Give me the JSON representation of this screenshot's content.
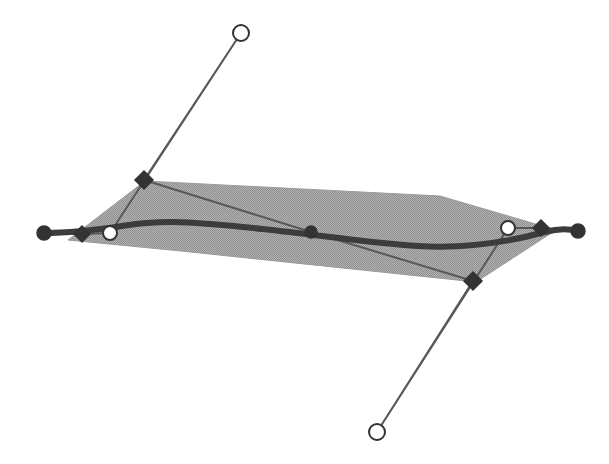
{
  "figure": {
    "title": "Spline curve with control polygon and shaded surface strip",
    "background_color": "#ffffff",
    "width": 609,
    "height": 464
  },
  "palette": {
    "surface_fill": "#a9a9a9",
    "surface_stroke": "#8f8f8f",
    "curve_color": "#3c3c3c",
    "polygon_line_color": "#585858",
    "marker_fill_dark": "#333333",
    "marker_fill_open": "#ffffff",
    "marker_stroke": "#333333"
  },
  "chart_data": {
    "type": "line",
    "title": "Spline curve with control polygon and shaded surface strip",
    "xlabel": "",
    "ylabel": "",
    "xlim": [
      0,
      609
    ],
    "ylim": [
      0,
      464
    ],
    "grid": false,
    "legend": "none",
    "annotations": [],
    "series": [
      {
        "name": "surface-strip",
        "kind": "polygon",
        "closed": true,
        "fill": "#a9a9a9",
        "points": [
          [
            68,
            240
          ],
          [
            145,
            181
          ],
          [
            440,
            196
          ],
          [
            556,
            230
          ],
          [
            476,
            282
          ],
          [
            181,
            251
          ]
        ]
      },
      {
        "name": "control-polygon",
        "kind": "polyline",
        "stroke": "#585858",
        "stroke_width": 2,
        "points": [
          [
            44,
            233
          ],
          [
            82,
            234
          ],
          [
            110,
            233
          ],
          [
            241,
            33
          ],
          [
            144,
            180
          ],
          [
            311,
            232
          ],
          [
            473,
            281
          ],
          [
            377,
            432
          ],
          [
            508,
            228
          ],
          [
            541,
            228
          ],
          [
            578,
            231
          ]
        ]
      },
      {
        "name": "spline-curve",
        "kind": "bezier",
        "stroke": "#3c3c3c",
        "stroke_width": 6,
        "path": "M 44 233 C 74 233 96 230 122 226 C 170 218 215 224 262 229 C 320 235 370 243 418 246 C 468 249 512 241 545 232 C 560 228 570 229 578 231"
      }
    ],
    "markers": [
      {
        "id": "p0",
        "shape": "circle",
        "style": "filled",
        "x": 44,
        "y": 233,
        "r": 7
      },
      {
        "id": "p1",
        "shape": "diamond",
        "style": "filled",
        "x": 82,
        "y": 234,
        "r": 8
      },
      {
        "id": "p2",
        "shape": "circle",
        "style": "open",
        "x": 110,
        "y": 233,
        "r": 7
      },
      {
        "id": "p3",
        "shape": "circle",
        "style": "open",
        "x": 241,
        "y": 33,
        "r": 8
      },
      {
        "id": "p4",
        "shape": "diamond",
        "style": "filled",
        "x": 144,
        "y": 180,
        "r": 9
      },
      {
        "id": "p5",
        "shape": "circle",
        "style": "filled",
        "x": 311,
        "y": 232,
        "r": 6
      },
      {
        "id": "p6",
        "shape": "diamond",
        "style": "filled",
        "x": 473,
        "y": 281,
        "r": 9
      },
      {
        "id": "p7",
        "shape": "circle",
        "style": "open",
        "x": 377,
        "y": 432,
        "r": 8
      },
      {
        "id": "p8",
        "shape": "circle",
        "style": "open",
        "x": 508,
        "y": 228,
        "r": 7
      },
      {
        "id": "p9",
        "shape": "diamond",
        "style": "filled",
        "x": 541,
        "y": 228,
        "r": 8
      },
      {
        "id": "p10",
        "shape": "circle",
        "style": "filled",
        "x": 578,
        "y": 231,
        "r": 7
      }
    ]
  }
}
